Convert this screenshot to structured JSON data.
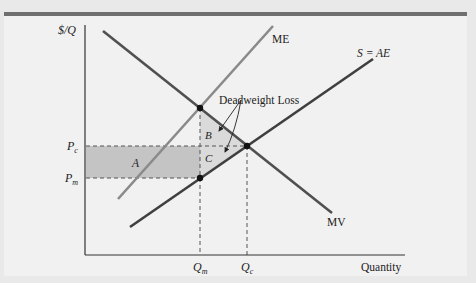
{
  "figure": {
    "y_axis_label": "$/Q",
    "x_axis_label": "Quantity",
    "curves": {
      "me": {
        "label": "ME",
        "color": "#8a8a8a"
      },
      "s_ae": {
        "label": "S = AE",
        "color": "#3f3f3f"
      },
      "mv": {
        "label": "MV",
        "color": "#505050"
      }
    },
    "price_labels": {
      "pc": {
        "main": "P",
        "sub": "c"
      },
      "pm": {
        "main": "P",
        "sub": "m"
      }
    },
    "quantity_labels": {
      "qm": {
        "main": "Q",
        "sub": "m"
      },
      "qc": {
        "main": "Q",
        "sub": "c"
      }
    },
    "regions": {
      "a": "A",
      "b": "B",
      "c": "C"
    },
    "annotation": "Deadweight Loss",
    "colors": {
      "panel_bg": "#f1f1f1",
      "top_bar": "#6f6f6f",
      "shaded_a": "#c4c4c4",
      "shaded_bc": "#dadada"
    }
  }
}
